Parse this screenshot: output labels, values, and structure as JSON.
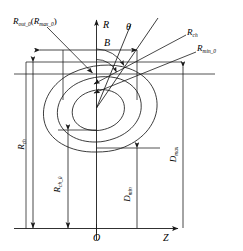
{
  "figure": {
    "type": "technical-schematic",
    "background_color": "#ffffff",
    "line_color": "#1a1a1a",
    "text_color": "#000000"
  },
  "axes": {
    "vertical_label": "R",
    "horizontal_label": "Z",
    "origin_label": "O"
  },
  "angles": {
    "theta": "θ",
    "b": "B"
  },
  "labels": {
    "r_out_0": {
      "base": "R",
      "sub": "out_0",
      "paren_base": "R",
      "paren_sub": "max_0",
      "full": "R_out_0(R_max_0)"
    },
    "r_ch_top": {
      "base": "R",
      "sub": "ch",
      "full": "R_ch"
    },
    "r_min_0": {
      "base": "R",
      "sub": "min_0",
      "full": "R_min_0"
    },
    "r_ch_left": {
      "base": "R",
      "sub": "ch",
      "full": "R_ch"
    },
    "r_ch_0": {
      "base": "R",
      "sub": "ch_0",
      "full": "R_ch_0"
    },
    "d_min": {
      "base": "D",
      "sub": "min",
      "full": "D_min"
    },
    "d_max": {
      "base": "D",
      "sub": "max",
      "full": "D_max"
    }
  },
  "contours": {
    "count": 3,
    "description": "three nested closed flux surfaces, outermost largest"
  },
  "dimension_arrows": [
    {
      "name": "r-out-0-leader",
      "orientation": "diagonal",
      "direction": "down-right"
    },
    {
      "name": "r-ch-top-leader",
      "orientation": "diagonal",
      "direction": "down-left"
    },
    {
      "name": "r-min-0-leader",
      "orientation": "diagonal",
      "direction": "down-left"
    },
    {
      "name": "r-ch-left-dimension",
      "orientation": "vertical",
      "direction": "double"
    },
    {
      "name": "r-ch-0-dimension",
      "orientation": "vertical",
      "direction": "double"
    },
    {
      "name": "d-min-dimension",
      "orientation": "vertical",
      "direction": "double"
    },
    {
      "name": "d-max-dimension",
      "orientation": "vertical",
      "direction": "double"
    },
    {
      "name": "top-width-dimension",
      "orientation": "horizontal",
      "direction": "double"
    }
  ]
}
